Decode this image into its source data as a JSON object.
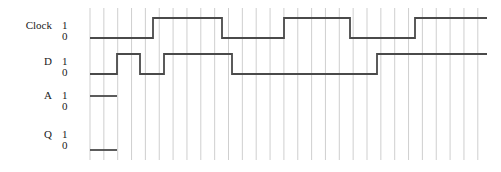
{
  "diagram": {
    "width": 501,
    "height": 172,
    "background": "#ffffff",
    "grid": {
      "visible": true,
      "color": "#c9c9c9",
      "line_width": 0.9,
      "x_start": 90,
      "x_end": 485,
      "y_top": 8,
      "y_bottom": 160,
      "spacing": 13.85,
      "count": 29
    },
    "waveform_style": {
      "color": "#4a4a4a",
      "line_width": 1.8
    }
  },
  "signals": [
    {
      "name": "Clock",
      "label": "Clock",
      "high_level_label": "1",
      "low_level_label": "0",
      "y_high": 18,
      "y_low": 38,
      "label_x": 45,
      "label_y": 26,
      "level_x": 62,
      "stub_only": false,
      "initial_level": 0,
      "transitions": [
        {
          "x": 153,
          "to": 1
        },
        {
          "x": 222,
          "to": 0
        },
        {
          "x": 284,
          "to": 1
        },
        {
          "x": 350,
          "to": 0
        },
        {
          "x": 415,
          "to": 1
        }
      ],
      "x_start": 90,
      "x_end": 487
    },
    {
      "name": "D",
      "label": "D",
      "high_level_label": "1",
      "low_level_label": "0",
      "y_high": 54,
      "y_low": 74,
      "label_x": 45,
      "label_y": 62,
      "level_x": 62,
      "stub_only": false,
      "initial_level": 0,
      "transitions": [
        {
          "x": 117,
          "to": 1
        },
        {
          "x": 140,
          "to": 0
        },
        {
          "x": 164,
          "to": 1
        },
        {
          "x": 232,
          "to": 0
        },
        {
          "x": 377,
          "to": 1
        }
      ],
      "x_start": 90,
      "x_end": 487
    },
    {
      "name": "A",
      "label": "A",
      "high_level_label": "1",
      "low_level_label": "0",
      "y_high": 96,
      "y_low": 112,
      "label_x": 45,
      "label_y": 100,
      "level_x": 62,
      "stub_only": true,
      "stub_level": 1,
      "x_start": 90,
      "x_end": 117
    },
    {
      "name": "Q",
      "label": "Q",
      "high_level_label": "1",
      "low_level_label": "0",
      "y_high": 150,
      "y_low": 164,
      "label_x": 45,
      "label_y": 140,
      "level_x": 62,
      "stub_only": true,
      "stub_level": 1,
      "x_start": 90,
      "x_end": 117
    }
  ],
  "level_rows": [
    {
      "one_y": 20,
      "zero_y": 31,
      "one": "1",
      "zero": "0"
    },
    {
      "one_y": 56,
      "zero_y": 67,
      "one": "1",
      "zero": "0"
    },
    {
      "one_y": 90,
      "zero_y": 101,
      "one": "1",
      "zero": "0"
    },
    {
      "one_y": 129,
      "zero_y": 140,
      "one": "1",
      "zero": "0"
    }
  ]
}
